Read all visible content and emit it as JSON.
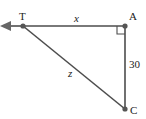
{
  "diagram": {
    "points": {
      "T": {
        "label": "T",
        "x": 23,
        "y": 26
      },
      "A": {
        "label": "A",
        "x": 125,
        "y": 26
      },
      "C": {
        "label": "C",
        "x": 125,
        "y": 109
      }
    },
    "segments": {
      "TA": {
        "label": "x"
      },
      "AC": {
        "label": "30"
      },
      "TC": {
        "label": "z"
      }
    },
    "right_angle_at": "A",
    "arrow_direction": "left",
    "colors": {
      "line": "#4d4d4d",
      "point": "#555555",
      "arrow": "#666666",
      "text": "#222222"
    }
  }
}
